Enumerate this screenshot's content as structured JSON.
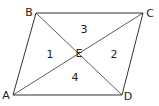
{
  "diagram": {
    "stroke_color": "#333333",
    "vertices": [
      {
        "name": "A",
        "x": 13,
        "y": 95,
        "lx": 6,
        "ly": 95
      },
      {
        "name": "B",
        "x": 36,
        "y": 13,
        "lx": 29,
        "ly": 12
      },
      {
        "name": "C",
        "x": 143,
        "y": 13,
        "lx": 150,
        "ly": 13
      },
      {
        "name": "D",
        "x": 122,
        "y": 95,
        "lx": 128,
        "ly": 96
      },
      {
        "name": "E",
        "x": 78,
        "y": 53,
        "lx": 79,
        "ly": 53
      }
    ],
    "regions": [
      {
        "label": "1",
        "x": 50,
        "y": 54
      },
      {
        "label": "2",
        "x": 114,
        "y": 54
      },
      {
        "label": "3",
        "x": 84,
        "y": 29
      },
      {
        "label": "4",
        "x": 75,
        "y": 77
      }
    ]
  }
}
